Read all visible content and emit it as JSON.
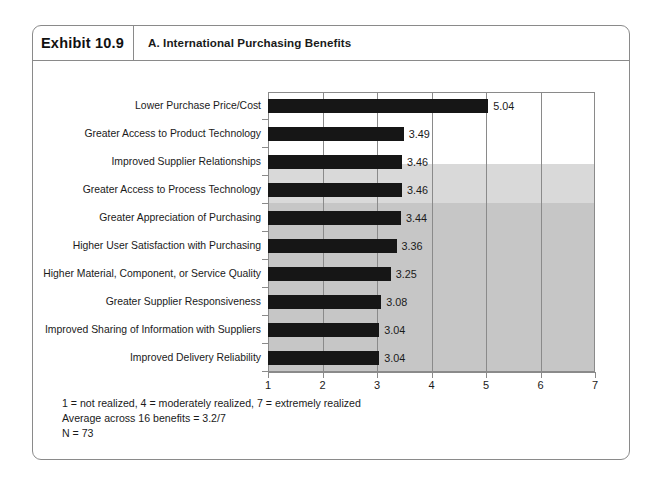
{
  "exhibit": {
    "number": "Exhibit 10.9",
    "title": "A. International Purchasing Benefits"
  },
  "footnotes": [
    "1 = not realized, 4 = moderately realized, 7 = extremely realized",
    "Average across 16 benefits = 3.2/7",
    "N = 73"
  ],
  "chart_data": {
    "type": "bar",
    "orientation": "horizontal",
    "title": "A. International Purchasing Benefits",
    "xlabel": "",
    "ylabel": "",
    "xlim": [
      1,
      7
    ],
    "xticks": [
      1,
      2,
      3,
      4,
      5,
      6,
      7
    ],
    "grid": true,
    "legend": null,
    "bar_color": "#161616",
    "band_colors": [
      "#ffffff",
      "#d9d9d9",
      "#c6c6c6"
    ],
    "categories": [
      "Lower Purchase Price/Cost",
      "Greater Access to Product Technology",
      "Improved Supplier Relationships",
      "Greater Access to Process Technology",
      "Greater Appreciation of Purchasing",
      "Higher User Satisfaction with Purchasing",
      "Higher Material, Component, or Service Quality",
      "Greater Supplier Responsiveness",
      "Improved Sharing of Information with Suppliers",
      "Improved Delivery Reliability"
    ],
    "values": [
      5.04,
      3.49,
      3.46,
      3.46,
      3.44,
      3.36,
      3.25,
      3.08,
      3.04,
      3.04
    ],
    "value_labels": [
      "5.04",
      "3.49",
      "3.46",
      "3.46",
      "3.44",
      "3.36",
      "3.25",
      "3.08",
      "3.04",
      "3.04"
    ],
    "notes": [
      "1 = not realized, 4 = moderately realized, 7 = extremely realized",
      "Average across 16 benefits = 3.2/7",
      "N = 73"
    ]
  }
}
